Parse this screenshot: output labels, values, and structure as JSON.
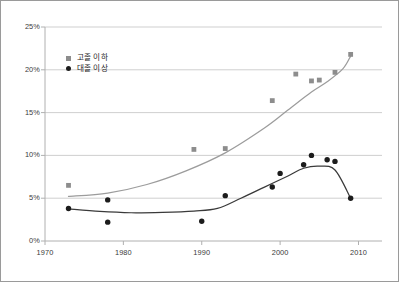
{
  "chart_data": {
    "type": "line",
    "title": "",
    "subtitle": "",
    "xlabel": "",
    "ylabel": "",
    "xlim": [
      1970,
      2013
    ],
    "ylim": [
      0,
      25
    ],
    "grid": true,
    "grid_axis": "y",
    "legend_position": "upper-left-inside",
    "x_ticks": [
      1970,
      1980,
      1990,
      2000,
      2010
    ],
    "x_tick_labels": [
      "1970",
      "1980",
      "1990",
      "2000",
      "2010"
    ],
    "y_ticks": [
      0,
      5,
      10,
      15,
      20,
      25
    ],
    "y_tick_labels": [
      "0%",
      "5%",
      "10%",
      "15%",
      "20%",
      "25%"
    ],
    "series": [
      {
        "name": "고졸 이하",
        "marker": "square",
        "color": "#8d8d8d",
        "line_color": "#9c9c9c",
        "points": [
          {
            "x": 1973,
            "y": 6.5
          },
          {
            "x": 1989,
            "y": 10.7
          },
          {
            "x": 1993,
            "y": 10.8
          },
          {
            "x": 1999,
            "y": 16.4
          },
          {
            "x": 2002,
            "y": 19.5
          },
          {
            "x": 2004,
            "y": 18.7
          },
          {
            "x": 2005,
            "y": 18.8
          },
          {
            "x": 2007,
            "y": 19.7
          },
          {
            "x": 2009,
            "y": 21.8
          }
        ],
        "trend": [
          {
            "x": 1973,
            "y": 5.2
          },
          {
            "x": 1978,
            "y": 5.6
          },
          {
            "x": 1983,
            "y": 6.6
          },
          {
            "x": 1988,
            "y": 8.2
          },
          {
            "x": 1993,
            "y": 10.3
          },
          {
            "x": 1998,
            "y": 13.2
          },
          {
            "x": 2001,
            "y": 15.3
          },
          {
            "x": 2004,
            "y": 17.4
          },
          {
            "x": 2006,
            "y": 18.6
          },
          {
            "x": 2008,
            "y": 20.1
          },
          {
            "x": 2009,
            "y": 21.6
          }
        ]
      },
      {
        "name": "대졸 이상",
        "marker": "circle",
        "color": "#1c1c1c",
        "line_color": "#3a3a3a",
        "points": [
          {
            "x": 1973,
            "y": 3.8
          },
          {
            "x": 1978,
            "y": 4.8
          },
          {
            "x": 1978,
            "y": 2.2
          },
          {
            "x": 1990,
            "y": 2.3
          },
          {
            "x": 1993,
            "y": 5.3
          },
          {
            "x": 1999,
            "y": 6.3
          },
          {
            "x": 2000,
            "y": 7.9
          },
          {
            "x": 2003,
            "y": 8.9
          },
          {
            "x": 2004,
            "y": 10.0
          },
          {
            "x": 2006,
            "y": 9.5
          },
          {
            "x": 2007,
            "y": 9.3
          },
          {
            "x": 2009,
            "y": 5.0
          }
        ],
        "trend": [
          {
            "x": 1973,
            "y": 3.75
          },
          {
            "x": 1977,
            "y": 3.45
          },
          {
            "x": 1981,
            "y": 3.3
          },
          {
            "x": 1985,
            "y": 3.35
          },
          {
            "x": 1989,
            "y": 3.5
          },
          {
            "x": 1992,
            "y": 3.8
          },
          {
            "x": 1995,
            "y": 5.0
          },
          {
            "x": 1998,
            "y": 6.3
          },
          {
            "x": 2001,
            "y": 7.6
          },
          {
            "x": 2003,
            "y": 8.5
          },
          {
            "x": 2005,
            "y": 8.75
          },
          {
            "x": 2007,
            "y": 8.3
          },
          {
            "x": 2009,
            "y": 5.0
          }
        ]
      }
    ]
  },
  "legend": {
    "items": [
      {
        "label": "고졸 이하",
        "marker": "square-marker-icon"
      },
      {
        "label": "대졸 이상",
        "marker": "circle-marker-icon"
      }
    ]
  },
  "colors": {
    "frame": "#9a9a9a",
    "grid": "#c9c9c9",
    "axis": "#b0b0b0",
    "series_light": "#8d8d8d",
    "series_dark": "#1c1c1c",
    "text": "#3b3b3b"
  }
}
